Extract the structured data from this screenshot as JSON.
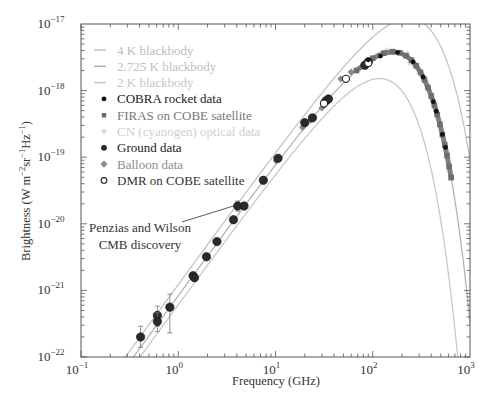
{
  "chart_data": {
    "type": "scatter",
    "title": "",
    "xlabel": "Frequency (GHz)",
    "ylabel": "Brightness (W m⁻²sr⁻¹Hz⁻¹)",
    "xscale": "log",
    "yscale": "log",
    "xlim": [
      0.1,
      1000
    ],
    "ylim": [
      1e-22,
      1e-17
    ],
    "grid": false,
    "legend_position": "upper-left",
    "x_ticks": [
      {
        "value": 0.1,
        "base": "10",
        "exp": "−1"
      },
      {
        "value": 1,
        "base": "10",
        "exp": "0"
      },
      {
        "value": 10,
        "base": "10",
        "exp": "1"
      },
      {
        "value": 100,
        "base": "10",
        "exp": "2"
      },
      {
        "value": 1000,
        "base": "10",
        "exp": "3"
      }
    ],
    "y_ticks": [
      {
        "value": 1e-17,
        "base": "10",
        "exp": "−17"
      },
      {
        "value": 1e-18,
        "base": "10",
        "exp": "−18"
      },
      {
        "value": 1e-19,
        "base": "10",
        "exp": "−19"
      },
      {
        "value": 1e-20,
        "base": "10",
        "exp": "−20"
      },
      {
        "value": 1e-21,
        "base": "10",
        "exp": "−21"
      },
      {
        "value": 1e-22,
        "base": "10",
        "exp": "−22"
      }
    ],
    "curves": [
      {
        "name": "4 K blackbody",
        "temperature_K": 4,
        "color": "#c4c4c4",
        "width": 1.3
      },
      {
        "name": "2.725 K blackbody",
        "temperature_K": 2.725,
        "color": "#b4b4b4",
        "width": 1.3
      },
      {
        "name": "2 K blackbody",
        "temperature_K": 2,
        "color": "#c8c8c8",
        "width": 1.3
      }
    ],
    "series": [
      {
        "name": "COBRA rocket data",
        "marker": "circle-small",
        "color": "#111111",
        "points": [
          [
            90,
            2.9e-18
          ],
          [
            120,
            3.3e-18
          ],
          [
            180,
            3.75e-18
          ],
          [
            260,
            2.7e-18
          ],
          [
            330,
            1.6e-18
          ],
          [
            420,
            6.8e-19
          ],
          [
            450,
            4.9e-19
          ],
          [
            520,
            2.2e-19
          ],
          [
            560,
            1.4e-19
          ]
        ]
      },
      {
        "name": "FIRAS on COBE satellite",
        "marker": "square",
        "color": "#6e6e6e",
        "points": [
          [
            68,
            2e-18
          ],
          [
            100,
            3.06e-18
          ],
          [
            130,
            3.65e-18
          ],
          [
            160,
            3.84e-18
          ],
          [
            190,
            3.7e-18
          ],
          [
            220,
            3.33e-18
          ],
          [
            250,
            2.86e-18
          ],
          [
            280,
            2.36e-18
          ],
          [
            310,
            1.88e-18
          ],
          [
            340,
            1.46e-18
          ],
          [
            370,
            1.11e-18
          ],
          [
            400,
            8.26e-19
          ],
          [
            430,
            6.04e-19
          ],
          [
            460,
            4.36e-19
          ],
          [
            490,
            3.11e-19
          ],
          [
            520,
            2.19e-19
          ],
          [
            550,
            1.53e-19
          ],
          [
            580,
            1.06e-19
          ],
          [
            610,
            7.25e-20
          ],
          [
            640,
            4.94e-20
          ]
        ]
      },
      {
        "name": "CN (cyanogen) optical data",
        "marker": "star",
        "color": "#d6d6d6",
        "points": [
          [
            113,
            3.5e-18
          ],
          [
            140,
            4.1e-18
          ],
          [
            227,
            3.6e-18
          ],
          [
            240,
            2.6e-18
          ]
        ]
      },
      {
        "name": "Ground data",
        "marker": "circle",
        "color": "#2a2a2a",
        "points": [
          {
            "x": 0.41,
            "y": 2e-22,
            "err": [
              1.4e-22,
              2.9e-22
            ]
          },
          {
            "x": 0.61,
            "y": 4.2e-22,
            "err": [
              2.9e-22,
              5.8e-22
            ]
          },
          {
            "x": 0.61,
            "y": 3.4e-22,
            "err": [
              2.4e-22,
              4.6e-22
            ]
          },
          {
            "x": 0.82,
            "y": 5.6e-22,
            "err": [
              2.3e-22,
              8.8e-22
            ]
          },
          {
            "x": 1.42,
            "y": 1.66e-21
          },
          {
            "x": 1.47,
            "y": 1.55e-21
          },
          {
            "x": 1.95,
            "y": 3.2e-21
          },
          {
            "x": 2.5,
            "y": 5.4e-21
          },
          {
            "x": 3.7,
            "y": 1.15e-20
          },
          {
            "x": 4.08,
            "y": 1.85e-20,
            "err": [
              1.55e-20,
              2.2e-20
            ]
          },
          {
            "x": 4.75,
            "y": 1.85e-20
          },
          {
            "x": 7.5,
            "y": 4.5e-20
          },
          {
            "x": 10.6,
            "y": 9.6e-20
          },
          {
            "x": 20,
            "y": 3.3e-19
          },
          {
            "x": 24,
            "y": 3.9e-19
          },
          {
            "x": 33,
            "y": 7e-19
          },
          {
            "x": 35,
            "y": 7.5e-19
          },
          {
            "x": 83,
            "y": 2.4e-18
          },
          {
            "x": 90,
            "y": 2.7e-18
          }
        ]
      },
      {
        "name": "Balloon data",
        "marker": "diamond",
        "color": "#8a8a8a",
        "points": [
          [
            10.2,
            8.8e-20
          ],
          [
            11,
            1e-19
          ],
          [
            19,
            2.8e-19
          ],
          [
            23,
            3.6e-19
          ],
          [
            30,
            5.5e-19
          ],
          [
            47,
            1.5e-18
          ],
          [
            60,
            1.9e-18
          ]
        ]
      },
      {
        "name": "DMR on COBE satellite",
        "marker": "circle-open",
        "color": "#222222",
        "points": [
          [
            31.5,
            6.4e-19
          ],
          [
            53,
            1.5e-18
          ],
          [
            90,
            2.6e-18
          ]
        ]
      }
    ],
    "annotations": [
      {
        "text_lines": [
          "Penzias and Wilson",
          "CMB discovery"
        ],
        "points_to": [
          4.08,
          1.85e-20
        ]
      }
    ]
  },
  "legend": {
    "items": [
      {
        "label": "4 K blackbody",
        "kind": "line",
        "color": "#c4c4c4",
        "text_color": "#bdbdbd"
      },
      {
        "label": "2.725 K blackbody",
        "kind": "line",
        "color": "#b4b4b4",
        "text_color": "#c0c0c0"
      },
      {
        "label": "2 K blackbody",
        "kind": "line",
        "color": "#c8c8c8",
        "text_color": "#c6c6c6"
      },
      {
        "label": "COBRA rocket data",
        "kind": "circle-small",
        "color": "#111111",
        "text_color": "#1a1a1a"
      },
      {
        "label": "FIRAS on COBE satellite",
        "kind": "square",
        "color": "#6e6e6e",
        "text_color": "#777777"
      },
      {
        "label": "CN (cyanogen) optical data",
        "kind": "star",
        "color": "#d6d6d6",
        "text_color": "#cfcfcf"
      },
      {
        "label": "Ground data",
        "kind": "circle",
        "color": "#2a2a2a",
        "text_color": "#222222"
      },
      {
        "label": "Balloon data",
        "kind": "diamond",
        "color": "#8a8a8a",
        "text_color": "#8c8c8c"
      },
      {
        "label": "DMR on COBE satellite",
        "kind": "circle-open",
        "color": "#222222",
        "text_color": "#333333"
      }
    ]
  },
  "annotation": {
    "line1": "Penzias and Wilson",
    "line2": "CMB discovery"
  }
}
